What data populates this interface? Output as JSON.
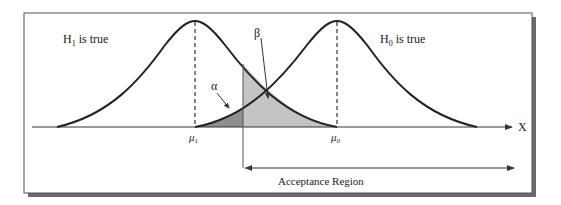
{
  "diagram": {
    "left_label": "H",
    "left_label_sub": "1",
    "left_label_rest": " is true",
    "right_label": "H",
    "right_label_sub": "0",
    "right_label_rest": " is true",
    "mu1": "μ",
    "mu1_sub": "1",
    "mu0": "μ",
    "mu0_sub": "0",
    "alpha": "α",
    "beta": "β",
    "axis_label": "X",
    "acceptance_region": "Acceptance Region"
  },
  "colors": {
    "curve": "#222222",
    "alpha_fill": "#8f8f8f",
    "beta_fill": "#c4c4c4",
    "frame": "#555555"
  }
}
